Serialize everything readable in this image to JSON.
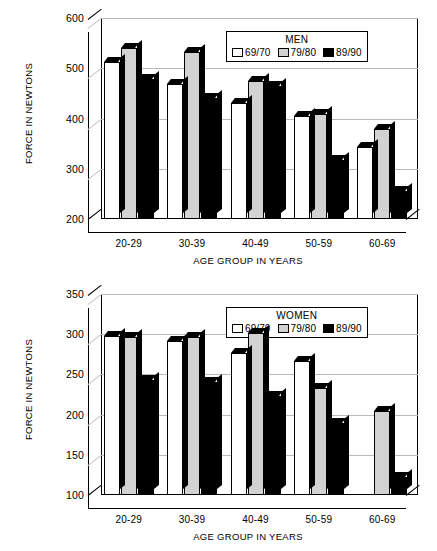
{
  "chart_data": [
    {
      "type": "bar",
      "title": "MEN",
      "xlabel": "AGE GROUP IN YEARS",
      "ylabel": "FORCE IN NEWTONS",
      "categories": [
        "20-29",
        "30-39",
        "40-49",
        "50-59",
        "60-69"
      ],
      "yticks": [
        200,
        300,
        400,
        500,
        600
      ],
      "ylim": [
        200,
        600
      ],
      "grid": true,
      "legend_position": "top-right",
      "series": [
        {
          "name": "69/70",
          "color": "#ffffff",
          "values": [
            512,
            468,
            430,
            405,
            344
          ]
        },
        {
          "name": "79/80",
          "color": "#d2d2d2",
          "values": [
            540,
            533,
            474,
            408,
            380
          ]
        },
        {
          "name": "89/90",
          "color": "#000000",
          "values": [
            478,
            440,
            464,
            318,
            255
          ]
        }
      ]
    },
    {
      "type": "bar",
      "title": "WOMEN",
      "xlabel": "AGE GROUP IN YEARS",
      "ylabel": "FORCE IN NEWTONS",
      "categories": [
        "20-29",
        "30-39",
        "40-49",
        "50-59",
        "60-69"
      ],
      "yticks": [
        100,
        150,
        200,
        250,
        300,
        350
      ],
      "ylim": [
        100,
        350
      ],
      "grid": true,
      "legend_position": "top-right",
      "series": [
        {
          "name": "69/70",
          "color": "#ffffff",
          "values": [
            298,
            291,
            277,
            267,
            null
          ]
        },
        {
          "name": "79/80",
          "color": "#d2d2d2",
          "values": [
            297,
            296,
            301,
            233,
            205
          ]
        },
        {
          "name": "89/90",
          "color": "#000000",
          "values": [
            243,
            240,
            223,
            190,
            123
          ]
        }
      ]
    }
  ],
  "panels": [
    {
      "id": "men",
      "legend_title": "MEN",
      "ylabel": "FORCE IN NEWTONS",
      "xlabel": "AGE GROUP IN YEARS",
      "ytick_labels": [
        "600",
        "500",
        "400",
        "300",
        "200"
      ],
      "xtick_labels": [
        "20-29",
        "30-39",
        "40-49",
        "50-59",
        "60-69"
      ],
      "legend_labels": [
        "69/70",
        "79/80",
        "89/90"
      ]
    },
    {
      "id": "women",
      "legend_title": "WOMEN",
      "ylabel": "FORCE IN NEWTONS",
      "xlabel": "AGE GROUP IN YEARS",
      "ytick_labels": [
        "350",
        "300",
        "250",
        "200",
        "150",
        "100"
      ],
      "xtick_labels": [
        "20-29",
        "30-39",
        "40-49",
        "50-59",
        "60-69"
      ],
      "legend_labels": [
        "69/70",
        "79/80",
        "89/90"
      ]
    }
  ]
}
